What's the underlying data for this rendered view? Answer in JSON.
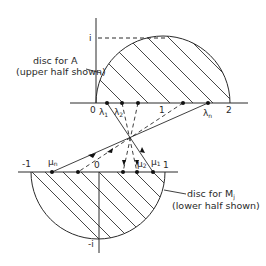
{
  "diagram": {
    "upper": {
      "annotation_line1": "disc for A",
      "annotation_line2": "(upper half shown)",
      "axis_labels": {
        "imag_top": "i",
        "origin": "0",
        "one": "1",
        "two": "2"
      },
      "eigen_labels": {
        "lambda1": "λ",
        "lambda1_sub": "1",
        "lambda2": "λ",
        "lambda2_sub": "2",
        "lambdan": "λ",
        "lambdan_sub": "n"
      }
    },
    "lower": {
      "annotation_line1": "disc for M",
      "annotation_line1_sub": "j",
      "annotation_line2": "(lower half shown)",
      "axis_labels": {
        "minus_one": "-1",
        "origin": "0",
        "one": "1",
        "imag_bottom": "-i"
      },
      "eigen_labels": {
        "mun": "μ",
        "mun_sub": "n",
        "mu2": "μ",
        "mu2_sub": "2",
        "mu1": "μ",
        "mu1_sub": "1"
      }
    },
    "colors": {
      "ink": "#2a2a2a",
      "background": "#ffffff"
    }
  }
}
